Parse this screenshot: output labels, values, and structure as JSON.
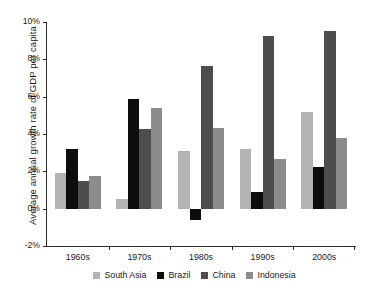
{
  "chart_data": {
    "type": "bar",
    "title": "",
    "xlabel": "",
    "ylabel": "Average annual growth rate of GDP per capita",
    "categories": [
      "1960s",
      "1970s",
      "1980s",
      "1990s",
      "2000s"
    ],
    "ylim": [
      -2,
      10
    ],
    "yticks": [
      -2,
      0,
      2,
      4,
      6,
      8,
      10
    ],
    "ytick_labels": [
      "-2%",
      "0%",
      "2%",
      "4%",
      "6%",
      "8%",
      "10%"
    ],
    "grid": false,
    "legend_position": "bottom",
    "series": [
      {
        "name": "South Asia",
        "color": "#b3b3b3",
        "values": [
          1.9,
          0.5,
          3.1,
          3.2,
          5.2
        ]
      },
      {
        "name": "Brazil",
        "color": "#0d0d0d",
        "values": [
          3.2,
          5.9,
          -0.6,
          0.9,
          2.25
        ]
      },
      {
        "name": "China",
        "color": "#4d4d4d",
        "values": [
          1.5,
          4.25,
          7.65,
          9.25,
          9.5
        ]
      },
      {
        "name": "Indonesia",
        "color": "#8c8c8c",
        "values": [
          1.75,
          5.4,
          4.3,
          2.65,
          3.8
        ]
      }
    ]
  }
}
